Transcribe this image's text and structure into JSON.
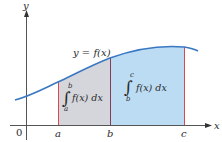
{
  "diagram": {
    "curve_label": "y = f(x)",
    "x_axis_label": "x",
    "y_axis_label": "y",
    "origin_label": "0",
    "ticks": [
      {
        "name": "a",
        "label": "a"
      },
      {
        "name": "b",
        "label": "b"
      },
      {
        "name": "c",
        "label": "c"
      }
    ],
    "integral_left": {
      "upper": "b",
      "lower": "a",
      "integrand": "f(x) dx"
    },
    "integral_right": {
      "upper": "c",
      "lower": "b",
      "integrand": "f(x) dx"
    },
    "colors": {
      "curve": "#3a78c2",
      "region_ab_fill": "#d4d6dc",
      "region_bc_fill": "#bcdcf4",
      "boundary_a": "#d9474f",
      "boundary_b": "#8a3a55",
      "boundary_c": "#d9474f",
      "axes": "#555555"
    }
  }
}
